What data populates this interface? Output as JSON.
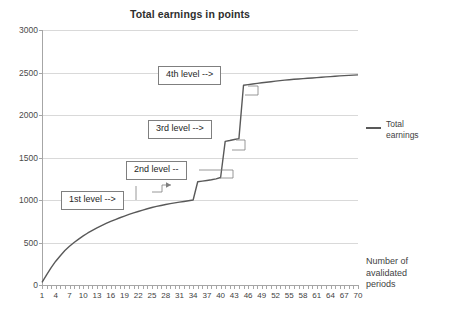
{
  "chart_data": {
    "type": "line",
    "title": "Total earnings in points",
    "xlabel": "Number of avalidated periods",
    "ylabel": "",
    "xlim": [
      1,
      70
    ],
    "ylim": [
      0,
      3000
    ],
    "ytick_labels": [
      "0",
      "500",
      "1000",
      "1500",
      "2000",
      "2500",
      "3000"
    ],
    "ytick_values": [
      0,
      500,
      1000,
      1500,
      2000,
      2500,
      3000
    ],
    "xtick_labels": [
      "1",
      "4",
      "7",
      "10",
      "13",
      "16",
      "19",
      "22",
      "25",
      "28",
      "31",
      "34",
      "37",
      "40",
      "43",
      "46",
      "49",
      "52",
      "55",
      "58",
      "61",
      "64",
      "67",
      "70"
    ],
    "xtick_values": [
      1,
      4,
      7,
      10,
      13,
      16,
      19,
      22,
      25,
      28,
      31,
      34,
      37,
      40,
      43,
      46,
      49,
      52,
      55,
      58,
      61,
      64,
      67,
      70
    ],
    "grid": "horizontal",
    "legend_position": "right",
    "series": [
      {
        "name": "Total earnings",
        "color": "#595959",
        "x": [
          1,
          2,
          3,
          4,
          5,
          6,
          7,
          8,
          9,
          10,
          11,
          12,
          13,
          14,
          15,
          16,
          17,
          18,
          19,
          20,
          21,
          22,
          23,
          24,
          25,
          26,
          27,
          28,
          29,
          30,
          31,
          32,
          33,
          34,
          35,
          36,
          37,
          38,
          39,
          40,
          41,
          42,
          43,
          44,
          45,
          46,
          47,
          48,
          49,
          50,
          51,
          52,
          53,
          54,
          55,
          56,
          57,
          58,
          59,
          60,
          61,
          62,
          63,
          64,
          65,
          66,
          67,
          68,
          69,
          70
        ],
        "values": [
          30,
          120,
          205,
          280,
          345,
          405,
          455,
          500,
          540,
          578,
          612,
          643,
          672,
          699,
          724,
          748,
          770,
          791,
          811,
          830,
          848,
          865,
          881,
          897,
          912,
          925,
          936,
          947,
          957,
          966,
          975,
          983,
          991,
          1000,
          1215,
          1222,
          1230,
          1238,
          1248,
          1265,
          1690,
          1700,
          1712,
          1722,
          2350,
          2358,
          2365,
          2372,
          2379,
          2386,
          2392,
          2398,
          2404,
          2410,
          2415,
          2420,
          2424,
          2428,
          2432,
          2436,
          2440,
          2444,
          2448,
          2452,
          2456,
          2460,
          2463,
          2466,
          2469,
          2472
        ]
      }
    ],
    "annotations": [
      {
        "id": "level-4",
        "label": "4th level -->",
        "target_x": 45,
        "target_y": 2350
      },
      {
        "id": "level-3",
        "label": "3rd level -->",
        "target_x": 41,
        "target_y": 1690
      },
      {
        "id": "level-2",
        "label": "2nd level --",
        "target_x": 35,
        "target_y": 1215
      },
      {
        "id": "level-1",
        "label": "1st level -->",
        "target_x": 34,
        "target_y": 1000
      }
    ]
  },
  "legend": {
    "entries": [
      {
        "label_line1": "Total",
        "label_line2": "earnings"
      }
    ]
  },
  "axis_titles": {
    "x_line1": "Number of",
    "x_line2": "avalidated",
    "x_line3": "periods"
  }
}
